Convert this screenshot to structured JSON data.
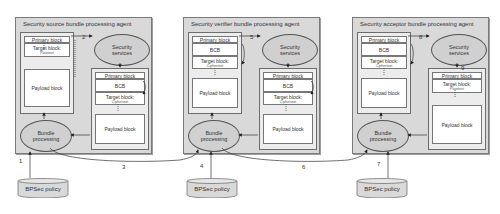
{
  "agents": [
    {
      "title": "Security source bundle processing agent",
      "left_bundle": {
        "blocks": [
          {
            "label": "Primary block"
          },
          {
            "label": "Target block:",
            "sub": "Plaintext"
          },
          {
            "label": "Payload block"
          }
        ]
      },
      "security_services": "Security services",
      "right_bundle": {
        "blocks": [
          {
            "label": "Primary block"
          },
          {
            "label": "BCB"
          },
          {
            "label": "Target block:",
            "sub": "Ciphertext"
          },
          {
            "label": "Payload block"
          }
        ]
      },
      "bundle_processing": "Bundle processing",
      "step_to_services": "2"
    },
    {
      "title": "Security verifier bundle processing agent",
      "left_bundle": {
        "blocks": [
          {
            "label": "Primary block"
          },
          {
            "label": "BCB"
          },
          {
            "label": "Target block:",
            "sub": "Ciphertext"
          },
          {
            "label": "Payload block"
          }
        ]
      },
      "security_services": "Security services",
      "right_bundle": {
        "blocks": [
          {
            "label": "Primary block"
          },
          {
            "label": "BCB"
          },
          {
            "label": "Target block:",
            "sub": "Ciphertext"
          },
          {
            "label": "Payload block"
          }
        ]
      },
      "bundle_processing": "Bundle processing",
      "step_to_services": "5"
    },
    {
      "title": "Security acceptor bundle processing agent",
      "left_bundle": {
        "blocks": [
          {
            "label": "Primary block"
          },
          {
            "label": "BCB"
          },
          {
            "label": "Target block:",
            "sub": "Ciphertext"
          },
          {
            "label": "Payload block"
          }
        ]
      },
      "security_services": "Security services",
      "right_bundle": {
        "blocks": [
          {
            "label": "Primary block"
          },
          {
            "label": "Target block:",
            "sub": "Plaintext"
          },
          {
            "label": "Payload block"
          }
        ]
      },
      "bundle_processing": "Bundle processing",
      "step_to_services": "8",
      "step_from_services": "9"
    }
  ],
  "policies": [
    {
      "label": "BPSec policy",
      "step": "1"
    },
    {
      "label": "BPSec policy",
      "step": "4"
    },
    {
      "label": "BPSec policy",
      "step": "7"
    }
  ],
  "transfers": [
    {
      "step": "3"
    },
    {
      "step": "6"
    }
  ]
}
